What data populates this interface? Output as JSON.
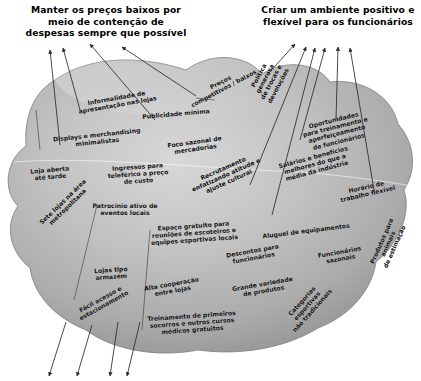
{
  "diagram": {
    "type": "activity-system-map",
    "language": "pt-BR",
    "title_text_present": false,
    "headings": [
      {
        "id": "heading-left",
        "name": "heading-cost-containment",
        "text": "Manter os preços baixos por\nmeio de contenção de\ndespesas sempre que possível",
        "x": 2,
        "y": 4,
        "width": 208
      },
      {
        "id": "heading-right",
        "name": "heading-positive-environment",
        "text": "Criar um ambiente positivo e\nflexível para os funcionários",
        "x": 258,
        "y": 4,
        "width": 160
      }
    ],
    "blob": {
      "name": "activity-blob",
      "fill_light": "#d2d2d2",
      "fill_mid": "#b0b0b0",
      "fill_dark": "#8e8e8e",
      "stroke": "#7d7d7d"
    },
    "arrow_color": "#2b2b2b",
    "nodes": [
      {
        "id": "n01",
        "name": "node-informalidade",
        "text": "Informalidade de\napresentação nas lojas",
        "x": 74,
        "y": 94,
        "w": 86,
        "rot": -10
      },
      {
        "id": "n02",
        "name": "node-displays",
        "text": "Displays e merchandising\nminimalistas",
        "x": 51,
        "y": 131,
        "w": 92,
        "rot": -6
      },
      {
        "id": "n03",
        "name": "node-loja-aberta",
        "text": "Loja aberta\naté tarde",
        "x": 26,
        "y": 166,
        "w": 48,
        "rot": -5
      },
      {
        "id": "n04",
        "name": "node-sete-lojas",
        "text": "Sete lojas na área\nmetropolitana",
        "x": 34,
        "y": 197,
        "w": 62,
        "rot": -44
      },
      {
        "id": "n05",
        "name": "node-patrocinio",
        "text": "Patrocínio ativo de\neventos locais",
        "x": 89,
        "y": 202,
        "w": 72,
        "rot": 0
      },
      {
        "id": "n06",
        "name": "node-lojas-armazem",
        "text": "Lojas tipo\narmazém",
        "x": 88,
        "y": 266,
        "w": 46,
        "rot": -4
      },
      {
        "id": "n07",
        "name": "node-facil-acesso",
        "text": "Fácil acesso e\nestacionamento",
        "x": 72,
        "y": 295,
        "w": 60,
        "rot": -29
      },
      {
        "id": "n08",
        "name": "node-ingressos",
        "text": "Ingressos para\nteleférico a preço\nde custo",
        "x": 105,
        "y": 163,
        "w": 66,
        "rot": -4
      },
      {
        "id": "n09",
        "name": "node-publicidade",
        "text": "Publicidade mínima",
        "x": 141,
        "y": 110,
        "w": 70,
        "rot": -5
      },
      {
        "id": "n10",
        "name": "node-foco-sazonal",
        "text": "Foco sazonal de\nmercadorias",
        "x": 164,
        "y": 138,
        "w": 62,
        "rot": -8
      },
      {
        "id": "n11",
        "name": "node-precos",
        "text": "Preços\ncompetitivos / baixos",
        "x": 183,
        "y": 78,
        "w": 78,
        "rot": -28
      },
      {
        "id": "n12",
        "name": "node-politica-trocas",
        "text": "Política\ngenerosa\nde trocas e\ndevoluções",
        "x": 237,
        "y": 66,
        "w": 62,
        "rot": -62
      },
      {
        "id": "n13",
        "name": "node-recrutamento",
        "text": "Recrutamento\nenfatizando atitude e\najuste cultural",
        "x": 185,
        "y": 164,
        "w": 82,
        "rot": -24
      },
      {
        "id": "n14",
        "name": "node-espaco-gratuito",
        "text": "Espaço gratuito para\nreuniões de escoteiros e\nequipes esportivas locais",
        "x": 148,
        "y": 222,
        "w": 92,
        "rot": -4
      },
      {
        "id": "n15",
        "name": "node-alta-cooperacao",
        "text": "Alta cooperação\nentre lojas",
        "x": 141,
        "y": 280,
        "w": 62,
        "rot": -10
      },
      {
        "id": "n16",
        "name": "node-treinamento-primeiros",
        "text": "Treinamento de primeiros\nsocorros e outros cursos\nmédicos gratuitos",
        "x": 146,
        "y": 312,
        "w": 92,
        "rot": -4
      },
      {
        "id": "n17",
        "name": "node-descontos",
        "text": "Descontos para\nfuncionários",
        "x": 222,
        "y": 247,
        "w": 62,
        "rot": -10
      },
      {
        "id": "n18",
        "name": "node-grande-variedade",
        "text": "Grande variedade\nde produtos",
        "x": 231,
        "y": 280,
        "w": 64,
        "rot": -10
      },
      {
        "id": "n19",
        "name": "node-categorias-esportivas",
        "text": "Categorias esportivas\nnão tradicionais",
        "x": 272,
        "y": 295,
        "w": 70,
        "rot": -48
      },
      {
        "id": "n20",
        "name": "node-aluguel-equipamentos",
        "text": "Aluguel de equipamentos",
        "x": 262,
        "y": 227,
        "w": 88,
        "rot": -7
      },
      {
        "id": "n21",
        "name": "node-funcionarios-sazonais",
        "text": "Funcionários\nsazonais",
        "x": 313,
        "y": 248,
        "w": 54,
        "rot": -10
      },
      {
        "id": "n22",
        "name": "node-produtos-animais",
        "text": "Produtos para animais\nde estimação",
        "x": 354,
        "y": 233,
        "w": 68,
        "rot": -66
      },
      {
        "id": "n23",
        "name": "node-horario-flexivel",
        "text": "Horário de\ntrabalho flexível",
        "x": 338,
        "y": 183,
        "w": 58,
        "rot": -13
      },
      {
        "id": "n24",
        "name": "node-salarios-beneficios",
        "text": "Salários e benefícios\nmelhores do que a\nmédia da indústria",
        "x": 277,
        "y": 153,
        "w": 76,
        "rot": -15
      },
      {
        "id": "n25",
        "name": "node-oportunidades",
        "text": "Oportunidades\npara treinamento e\naperfeiçoamento\nde funcionários",
        "x": 299,
        "y": 116,
        "w": 74,
        "rot": -14
      }
    ],
    "arrows": {
      "to_heading_left_count": 4,
      "to_heading_right_count": 6,
      "bottom_open_count": 4
    }
  }
}
